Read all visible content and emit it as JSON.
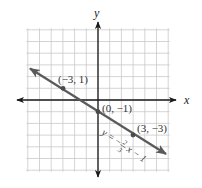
{
  "chart_data": {
    "type": "line",
    "title": "",
    "xlabel": "x",
    "ylabel": "y",
    "xlim": [
      -6,
      6
    ],
    "ylim": [
      -6,
      6
    ],
    "grid": true,
    "grid_step": 1,
    "series": [
      {
        "name": "y = -2/3 x - 1",
        "equation": "y = −(2/3)x − 1",
        "slope": -0.6667,
        "intercept": -1,
        "x": [
          -5.9,
          5.9
        ],
        "y": [
          2.93,
          -4.93
        ],
        "arrows_both_ends": true
      }
    ],
    "points": [
      {
        "x": -3,
        "y": 1,
        "label": "(−3, 1)"
      },
      {
        "x": 0,
        "y": -1,
        "label": "(0, −1)"
      },
      {
        "x": 3,
        "y": -3,
        "label": "(3, −3)"
      }
    ],
    "annotations": [
      {
        "text": "y = −(2/3)x − 1",
        "position": "along line, lower right"
      }
    ],
    "colors": {
      "grid": "#c9c9c9",
      "axes": "#1a1a1a",
      "line": "#5a5a5a",
      "points": "#4a4a4a"
    }
  },
  "labels": {
    "x_axis": "x",
    "y_axis": "y",
    "point_a": "(−3, 1)",
    "point_b": "(0, −1)",
    "point_c": "(3, −3)",
    "eq_y": "y =",
    "eq_minus": "−",
    "eq_num": "2",
    "eq_den": "3",
    "eq_tail": "x − 1"
  }
}
